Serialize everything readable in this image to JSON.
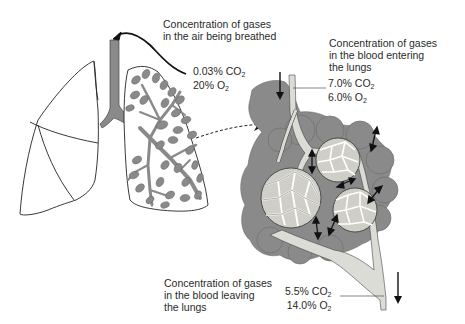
{
  "diagram": {
    "colors": {
      "tissue_gray": "#8a8a8a",
      "vessel_fill": "#dcdcd6",
      "capillary_fill": "#cfcfc8",
      "outline": "#222222",
      "background": "#ffffff"
    },
    "labels": {
      "air_breathed": {
        "lines": [
          "Concentration of gases",
          "in the air being breathed"
        ],
        "co2_value": "0.03%",
        "co2_label": "CO",
        "co2_sub": "2",
        "o2_value": "20%",
        "o2_label": "O",
        "o2_sub": "2"
      },
      "blood_entering": {
        "lines": [
          "Concentration of gases",
          "in the blood entering",
          "the lungs"
        ],
        "co2_value": "7.0%",
        "co2_label": "CO",
        "co2_sub": "2",
        "o2_value": "6.0%",
        "o2_label": "O",
        "o2_sub": "2"
      },
      "blood_leaving": {
        "lines": [
          "Concentration of gases",
          "in the blood leaving",
          "the lungs"
        ],
        "co2_value": "5.5%",
        "co2_label": "CO",
        "co2_sub": "2",
        "o2_value": "14.0%",
        "o2_label": "O",
        "o2_sub": "2"
      }
    },
    "parts": [
      "left-lung-outline",
      "right-lung-bronchial-tree",
      "trachea",
      "alveoli-cluster-detail",
      "blood-vessel-in",
      "blood-vessel-out",
      "exchange-arrows"
    ]
  }
}
